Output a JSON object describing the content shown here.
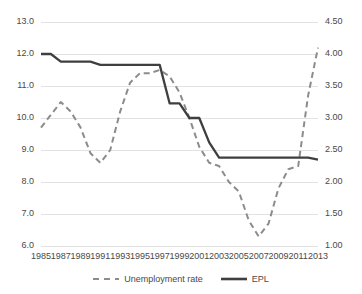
{
  "chart_data": {
    "type": "line",
    "title": "",
    "xlabel": "",
    "ylabel": "",
    "grid": true,
    "legend_position": "bottom",
    "x": [
      1985,
      1986,
      1987,
      1988,
      1989,
      1990,
      1991,
      1992,
      1993,
      1994,
      1995,
      1996,
      1997,
      1998,
      1999,
      2000,
      2001,
      2002,
      2003,
      2004,
      2005,
      2006,
      2007,
      2008,
      2009,
      2010,
      2011,
      2012,
      2013
    ],
    "xtick_labels": [
      "1985",
      "1987",
      "1989",
      "1991",
      "1993",
      "1995",
      "1997",
      "1999",
      "2001",
      "2003",
      "2005",
      "2007",
      "2009",
      "2011",
      "2013"
    ],
    "xticks": [
      1985,
      1987,
      1989,
      1991,
      1993,
      1995,
      1997,
      1999,
      2001,
      2003,
      2005,
      2007,
      2009,
      2011,
      2013
    ],
    "axes": {
      "left": {
        "label": "",
        "ylim": [
          6.0,
          13.0
        ],
        "ticks": [
          6.0,
          7.0,
          8.0,
          9.0,
          10.0,
          11.0,
          12.0,
          13.0
        ],
        "tick_labels": [
          "6.0",
          "7.0",
          "8.0",
          "9.0",
          "10.0",
          "11.0",
          "12.0",
          "13.0"
        ]
      },
      "right": {
        "label": "",
        "ylim": [
          1.0,
          4.5
        ],
        "ticks": [
          1.0,
          1.5,
          2.0,
          2.5,
          3.0,
          3.5,
          4.0,
          4.5
        ],
        "tick_labels": [
          "1.00",
          "1.50",
          "2.00",
          "2.50",
          "3.00",
          "3.50",
          "4.00",
          "4.50"
        ]
      }
    },
    "series": [
      {
        "name": "Unemployment rate",
        "axis": "left",
        "style": "dashed",
        "color": "#8c8c8c",
        "values": [
          9.7,
          10.1,
          10.5,
          10.2,
          9.7,
          8.9,
          8.6,
          9.0,
          10.2,
          11.1,
          11.4,
          11.4,
          11.5,
          11.3,
          10.8,
          10.0,
          9.1,
          8.6,
          8.5,
          8.0,
          7.7,
          6.8,
          6.3,
          6.7,
          7.8,
          8.4,
          8.5,
          10.7,
          12.2
        ]
      },
      {
        "name": "EPL",
        "axis": "right",
        "style": "solid",
        "color": "#3f3f3f",
        "values": [
          4.0,
          4.0,
          3.88,
          3.88,
          3.88,
          3.88,
          3.83,
          3.83,
          3.83,
          3.83,
          3.83,
          3.83,
          3.83,
          3.23,
          3.23,
          3.0,
          3.0,
          2.62,
          2.38,
          2.38,
          2.38,
          2.38,
          2.38,
          2.38,
          2.38,
          2.38,
          2.38,
          2.38,
          2.35
        ]
      }
    ]
  },
  "legend": {
    "items": [
      {
        "label": "Unemployment rate",
        "style": "dashed",
        "color": "#8c8c8c"
      },
      {
        "label": "EPL",
        "style": "solid",
        "color": "#3f3f3f"
      }
    ]
  }
}
